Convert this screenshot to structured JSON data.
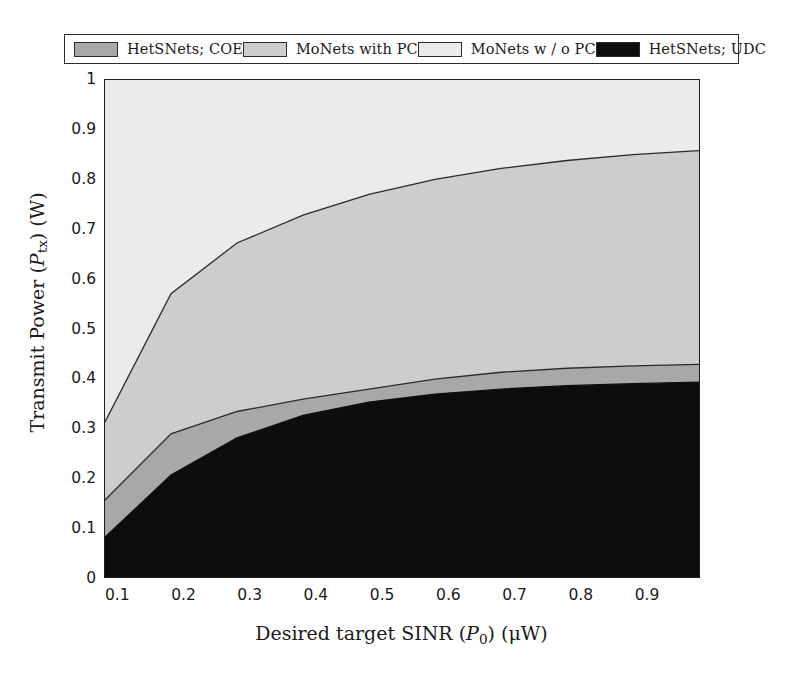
{
  "legend": {
    "entries": [
      {
        "label": "HetSNets; COE",
        "color": "#a8a8a8",
        "key": "hetsnets_coe"
      },
      {
        "label": "MoNets with PC",
        "color": "#cdcdcd",
        "key": "monets_with_pc"
      },
      {
        "label": "MoNets w / o PC",
        "color": "#ebebeb",
        "key": "monets_wo_pc"
      },
      {
        "label": "HetSNets; UDC",
        "color": "#0d0d0d",
        "key": "hetsnets_udc"
      }
    ]
  },
  "axes": {
    "y_title_prefix": "Transmit Power (",
    "y_title_var": "P",
    "y_title_sub": "tx",
    "y_title_suffix": ") (W)",
    "x_title_prefix": "Desired target SINR (",
    "x_title_var": "P",
    "x_title_sub": "0",
    "x_title_suffix": ") (μW)",
    "y_ticks": [
      "0",
      "0.1",
      "0.2",
      "0.3",
      "0.4",
      "0.5",
      "0.6",
      "0.7",
      "0.8",
      "0.9",
      "1"
    ],
    "x_ticks": [
      "0.1",
      "0.2",
      "0.3",
      "0.4",
      "0.5",
      "0.6",
      "0.7",
      "0.8",
      "0.9"
    ]
  },
  "chart_data": {
    "type": "area",
    "title": "",
    "xlabel": "Desired target SINR (P0) (μW)",
    "ylabel": "Transmit Power (Ptx) (W)",
    "xlim": [
      0.08,
      0.98
    ],
    "ylim": [
      0,
      1
    ],
    "grid": false,
    "stacked": true,
    "legend_position": "top",
    "x": [
      0.08,
      0.18,
      0.28,
      0.38,
      0.48,
      0.58,
      0.68,
      0.78,
      0.88,
      0.98
    ],
    "series": [
      {
        "name": "HetSNets; UDC",
        "color": "#0d0d0d",
        "boundary_upper": [
          0.08,
          0.205,
          0.28,
          0.325,
          0.352,
          0.368,
          0.378,
          0.385,
          0.389,
          0.392
        ],
        "values": [
          0.08,
          0.205,
          0.28,
          0.325,
          0.352,
          0.368,
          0.378,
          0.385,
          0.389,
          0.392
        ]
      },
      {
        "name": "HetSNets; COE",
        "color": "#a8a8a8",
        "boundary_upper": [
          0.155,
          0.288,
          0.333,
          0.358,
          0.378,
          0.398,
          0.412,
          0.42,
          0.425,
          0.428
        ],
        "values": [
          0.075,
          0.083,
          0.053,
          0.033,
          0.026,
          0.03,
          0.034,
          0.035,
          0.036,
          0.036
        ]
      },
      {
        "name": "MoNets with PC",
        "color": "#cdcdcd",
        "boundary_upper": [
          0.312,
          0.57,
          0.672,
          0.728,
          0.77,
          0.8,
          0.822,
          0.838,
          0.85,
          0.858
        ],
        "values": [
          0.157,
          0.282,
          0.339,
          0.37,
          0.392,
          0.402,
          0.41,
          0.418,
          0.425,
          0.43
        ]
      },
      {
        "name": "MoNets w / o PC",
        "color": "#ebebeb",
        "boundary_upper": [
          1.0,
          1.0,
          1.0,
          1.0,
          1.0,
          1.0,
          1.0,
          1.0,
          1.0,
          1.0
        ],
        "values": [
          0.688,
          0.43,
          0.328,
          0.272,
          0.23,
          0.2,
          0.178,
          0.162,
          0.15,
          0.142
        ]
      }
    ]
  }
}
